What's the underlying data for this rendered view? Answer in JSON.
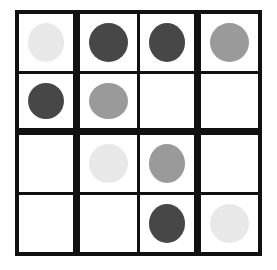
{
  "board": {
    "title": "4x4 token grid",
    "rows": 4,
    "cols": 4,
    "background_color": "#ffffff",
    "grid_line_color": "#111111",
    "cell_fill_color": "#ffffff",
    "token_shape": "circle",
    "token_colors": {
      "light": "#e8e8e8",
      "medium": "#9a9a9a",
      "dark": "#474747",
      "empty": "none"
    },
    "cells": [
      [
        {
          "token": "light",
          "color": "#e8e8e8",
          "label": "light circle"
        },
        {
          "token": "dark",
          "color": "#474747",
          "label": "dark circle"
        },
        {
          "token": "dark",
          "color": "#474747",
          "label": "dark circle"
        },
        {
          "token": "medium",
          "color": "#9a9a9a",
          "label": "medium circle"
        }
      ],
      [
        {
          "token": "dark",
          "color": "#474747",
          "label": "dark circle"
        },
        {
          "token": "medium",
          "color": "#9a9a9a",
          "label": "medium circle"
        },
        {
          "token": "empty",
          "color": "none",
          "label": "empty cell"
        },
        {
          "token": "empty",
          "color": "none",
          "label": "empty cell"
        }
      ],
      [
        {
          "token": "empty",
          "color": "none",
          "label": "empty cell"
        },
        {
          "token": "light",
          "color": "#e8e8e8",
          "label": "light circle"
        },
        {
          "token": "medium",
          "color": "#9a9a9a",
          "label": "medium circle"
        },
        {
          "token": "empty",
          "color": "none",
          "label": "empty cell"
        }
      ],
      [
        {
          "token": "empty",
          "color": "none",
          "label": "empty cell"
        },
        {
          "token": "empty",
          "color": "none",
          "label": "empty cell"
        },
        {
          "token": "dark",
          "color": "#474747",
          "label": "dark circle"
        },
        {
          "token": "light",
          "color": "#e8e8e8",
          "label": "light circle"
        }
      ]
    ]
  }
}
